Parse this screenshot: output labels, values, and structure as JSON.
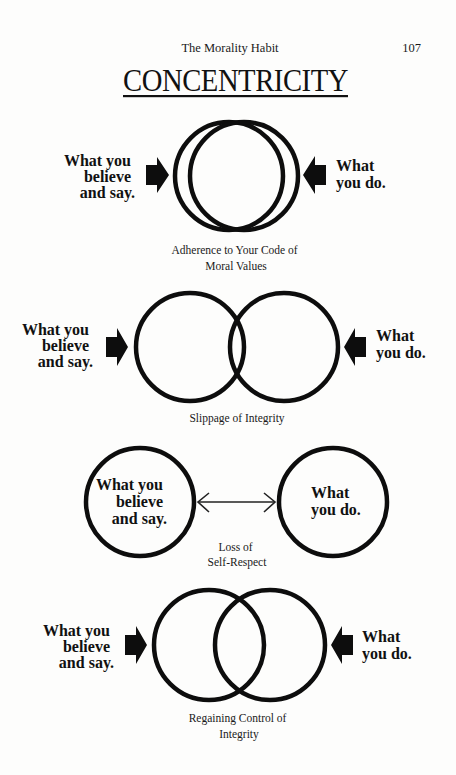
{
  "page": {
    "running_head": "The Morality Habit",
    "page_number": "107",
    "title": "CONCENTRICITY"
  },
  "diagrams": [
    {
      "name": "adherence",
      "left_label": [
        "What you",
        "believe",
        "and say."
      ],
      "right_label": [
        "What",
        "you do."
      ],
      "caption": [
        "Adherence to Your Code of",
        "Moral Values"
      ]
    },
    {
      "name": "slippage",
      "left_label": [
        "What you",
        "believe",
        "and say."
      ],
      "right_label": [
        "What",
        "you do."
      ],
      "caption": [
        "Slippage of Integrity"
      ]
    },
    {
      "name": "loss",
      "left_label": [
        "What you",
        "believe",
        "and say."
      ],
      "right_label": [
        "What",
        "you do."
      ],
      "caption": [
        "Loss of",
        "Self-Respect"
      ]
    },
    {
      "name": "regaining",
      "left_label": [
        "What you",
        "believe",
        "and say."
      ],
      "right_label": [
        "What",
        "you do."
      ],
      "caption": [
        "Regaining Control of",
        "Integrity"
      ]
    }
  ],
  "icons": {
    "block_arrow_right": "right-pointing block arrow",
    "block_arrow_left": "left-pointing block arrow",
    "double_arrow": "two-headed horizontal arrow"
  }
}
